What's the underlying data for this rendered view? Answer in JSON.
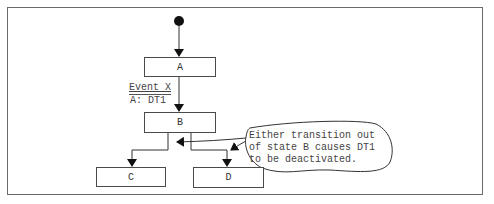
{
  "diagram": {
    "type": "state-machine",
    "states": [
      {
        "id": "A",
        "label": "A"
      },
      {
        "id": "B",
        "label": "B"
      },
      {
        "id": "C",
        "label": "C"
      },
      {
        "id": "D",
        "label": "D"
      }
    ],
    "transitions": [
      {
        "from": "initial",
        "to": "A"
      },
      {
        "from": "A",
        "to": "B",
        "event": "Event X",
        "action": "A: DT1"
      },
      {
        "from": "B",
        "to": "C"
      },
      {
        "from": "B",
        "to": "D"
      }
    ],
    "note": {
      "lines": [
        "Either transition out",
        "of state B causes DT1",
        "to be deactivated."
      ]
    }
  }
}
